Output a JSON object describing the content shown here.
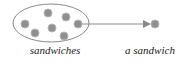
{
  "diagram": {
    "set_label": "sandwiches",
    "element_label": "a sandwich",
    "colors": {
      "ellipse_stroke": "#8a8a8a",
      "dot_fill": "#8f8f8f",
      "dot_stroke": "#b0b0b0",
      "arrow": "#8a8a8a",
      "text": "#222222"
    },
    "set_dots": [
      {
        "x": 48,
        "y": 13
      },
      {
        "x": 66,
        "y": 17
      },
      {
        "x": 78,
        "y": 24
      },
      {
        "x": 25,
        "y": 24
      },
      {
        "x": 52,
        "y": 28
      },
      {
        "x": 35,
        "y": 33
      },
      {
        "x": 64,
        "y": 36
      }
    ],
    "element_dot": {
      "x": 155,
      "y": 24
    }
  }
}
